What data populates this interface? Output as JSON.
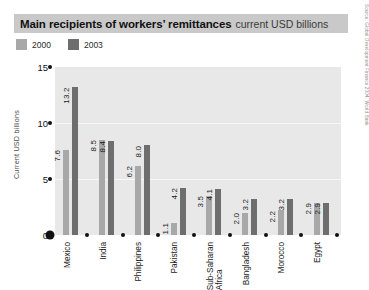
{
  "title": {
    "main": "Main recipients of workers’ remittances",
    "subtitle": "current USD billions"
  },
  "source": "Source: Global Development Finance 2004, World Bank",
  "legend": [
    {
      "label": "2000",
      "color": "#a8a8a8",
      "name": "legend-swatch-2000"
    },
    {
      "label": "2003",
      "color": "#6e6e6e",
      "name": "legend-swatch-2003"
    }
  ],
  "axis": {
    "y_title": "Current USD billions",
    "y_ticks": [
      "0",
      "5",
      "10",
      "15"
    ]
  },
  "colors": {
    "series_2000": "#a8a8a8",
    "series_2003": "#6e6e6e",
    "plot_background": "#e8e8e8",
    "title_background": "#c9c9c9",
    "gridline": "#f7f7f7",
    "axis_mark": "#111111"
  },
  "chart_data": {
    "type": "bar",
    "title": "Main recipients of workers’ remittances",
    "subtitle": "current USD billions",
    "xlabel": "",
    "ylabel": "Current USD billions",
    "ylim": [
      0,
      15
    ],
    "yticks": [
      0,
      5,
      10,
      15
    ],
    "grid": true,
    "legend_position": "top-left",
    "categories": [
      "Mexico",
      "India",
      "Philippines",
      "Pakistan",
      "Sub-Saharan Africa",
      "Bangladesh",
      "Morocco",
      "Egypt"
    ],
    "category_lines": [
      [
        "Mexico"
      ],
      [
        "India"
      ],
      [
        "Philippines"
      ],
      [
        "Pakistan"
      ],
      [
        "Sub-Saharan",
        "Africa"
      ],
      [
        "Bangladesh"
      ],
      [
        "Morocco"
      ],
      [
        "Egypt"
      ]
    ],
    "series": [
      {
        "name": "2000",
        "color": "#a8a8a8",
        "values": [
          7.6,
          8.5,
          6.2,
          1.1,
          3.5,
          2.0,
          2.2,
          2.9
        ],
        "labels": [
          "7.6",
          "8.5",
          "6.2",
          "1.1",
          "3.5",
          "2.0",
          "2.2",
          "2.9"
        ]
      },
      {
        "name": "2003",
        "color": "#6e6e6e",
        "values": [
          13.2,
          8.4,
          8.0,
          4.2,
          4.1,
          3.2,
          3.2,
          2.9
        ],
        "labels": [
          "13.2",
          "8.4",
          "8.0",
          "4.2",
          "4.1",
          "3.2",
          "3.2",
          "2.9"
        ]
      }
    ]
  }
}
